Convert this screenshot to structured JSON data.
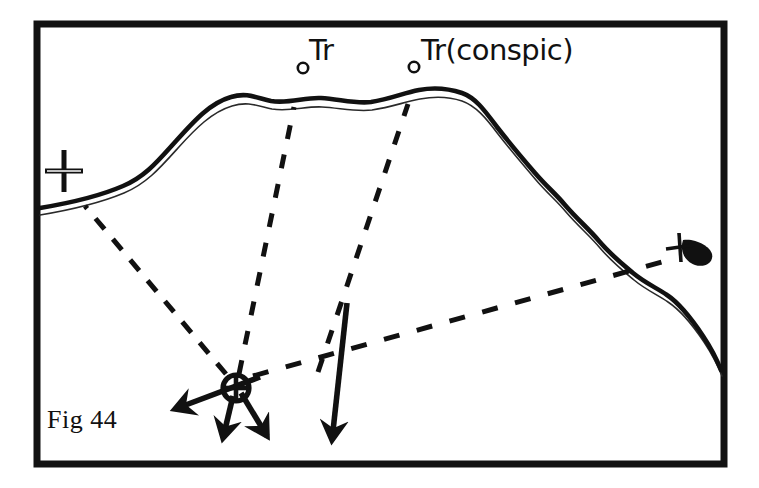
{
  "figure": {
    "caption": "Fig 44",
    "frame_color": "#121212",
    "ink_color": "#111111",
    "background_color": "#ffffff",
    "width": 759,
    "height": 488
  },
  "labels": [
    {
      "id": "tr-1",
      "text": "Tr",
      "x": 309,
      "y": 36
    },
    {
      "id": "tr-2",
      "text": "Tr(conspic)",
      "x": 421,
      "y": 36
    }
  ],
  "landmarks": [
    {
      "name": "tower-marker-left",
      "symbol": "small-circle",
      "x": 303,
      "y": 68
    },
    {
      "name": "tower-marker-right",
      "symbol": "small-circle",
      "x": 414,
      "y": 67
    },
    {
      "name": "church-cross-marker",
      "symbol": "plus-cross",
      "x": 64,
      "y": 171
    },
    {
      "name": "beacon-blob-marker",
      "symbol": "cross-with-teardrop",
      "x": 683,
      "y": 247
    }
  ],
  "fix": {
    "name": "observer-fix",
    "symbol": "circled-cross",
    "x": 236,
    "y": 388,
    "radius": 13
  },
  "bearing_lines": [
    {
      "name": "bearing-to-church-cross",
      "style": "dashed",
      "from_x": 226,
      "from_y": 374,
      "to_x": 85,
      "to_y": 206
    },
    {
      "name": "bearing-to-tower-left",
      "style": "dashed",
      "from_x": 239,
      "from_y": 374,
      "to_x": 294,
      "to_y": 107
    },
    {
      "name": "bearing-to-tower-right",
      "style": "dashed",
      "from_x": 318,
      "from_y": 372,
      "to_x": 408,
      "to_y": 104
    },
    {
      "name": "bearing-to-beacon-blob",
      "style": "dashed",
      "from_x": 253,
      "from_y": 376,
      "to_x": 676,
      "to_y": 258
    }
  ],
  "direction_arrows": [
    {
      "name": "arrow-west",
      "from_x": 252,
      "from_y": 380,
      "to_x": 166,
      "to_y": 412
    },
    {
      "name": "arrow-south",
      "from_x": 232,
      "from_y": 398,
      "to_x": 222,
      "to_y": 449
    },
    {
      "name": "arrow-southeast",
      "from_x": 240,
      "from_y": 394,
      "to_x": 273,
      "to_y": 447
    },
    {
      "name": "arrow-long-south",
      "from_x": 346,
      "from_y": 305,
      "to_x": 330,
      "to_y": 452
    }
  ],
  "coastline": {
    "name": "coastline",
    "description": "double-line shore with thick upper stroke and thin parallel lower stroke",
    "thick_stroke": 4.5,
    "thin_stroke": 1.4
  }
}
